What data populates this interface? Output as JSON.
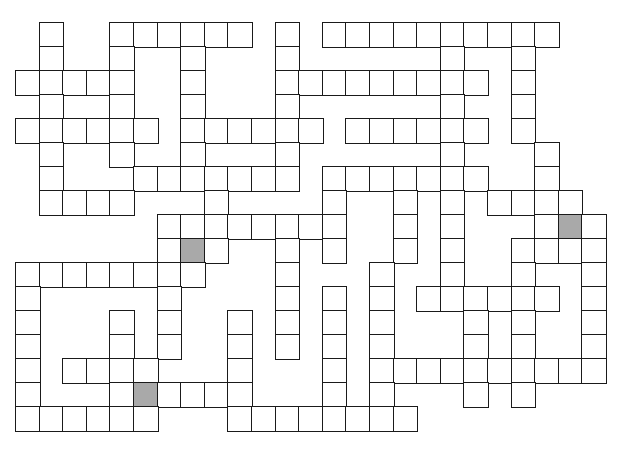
{
  "puzzle": {
    "type": "crossword",
    "rows": 17,
    "cols": 25,
    "colors": {
      "cell": "#ffffff",
      "border": "#1a1a1a",
      "shaded": "#a9a9a9"
    },
    "layout": [
      {
        "row": 0,
        "cells": [
          1,
          4,
          5,
          6,
          7,
          8,
          9,
          11,
          13,
          14,
          15,
          16,
          17,
          18,
          19,
          20,
          21,
          22
        ]
      },
      {
        "row": 1,
        "cells": [
          1,
          4,
          7,
          11,
          18,
          21
        ]
      },
      {
        "row": 2,
        "cells": [
          0,
          1,
          2,
          3,
          4,
          7,
          11,
          12,
          13,
          14,
          15,
          16,
          17,
          18,
          19,
          21
        ]
      },
      {
        "row": 3,
        "cells": [
          1,
          4,
          7,
          11,
          18,
          21
        ]
      },
      {
        "row": 4,
        "cells": [
          0,
          1,
          2,
          3,
          4,
          5,
          7,
          8,
          9,
          10,
          11,
          12,
          14,
          15,
          16,
          17,
          18,
          19,
          21
        ]
      },
      {
        "row": 5,
        "cells": [
          1,
          4,
          7,
          11,
          18,
          22
        ]
      },
      {
        "row": 6,
        "cells": [
          1,
          5,
          6,
          7,
          8,
          9,
          10,
          11,
          13,
          14,
          15,
          16,
          17,
          18,
          19,
          22
        ]
      },
      {
        "row": 7,
        "cells": [
          1,
          2,
          3,
          4,
          8,
          13,
          16,
          18,
          20,
          21,
          22,
          23
        ]
      },
      {
        "row": 8,
        "cells": [
          6,
          7,
          8,
          9,
          10,
          11,
          12,
          13,
          16,
          18,
          22,
          23,
          24
        ]
      },
      {
        "row": 9,
        "cells": [
          6,
          7,
          8,
          11,
          13,
          16,
          18,
          21,
          22,
          23,
          24
        ]
      },
      {
        "row": 10,
        "cells": [
          0,
          1,
          2,
          3,
          4,
          5,
          6,
          7,
          11,
          15,
          18,
          21,
          24
        ]
      },
      {
        "row": 11,
        "cells": [
          0,
          6,
          11,
          13,
          15,
          17,
          18,
          19,
          20,
          21,
          22,
          24
        ]
      },
      {
        "row": 12,
        "cells": [
          0,
          4,
          6,
          9,
          11,
          13,
          15,
          19,
          21,
          24
        ]
      },
      {
        "row": 13,
        "cells": [
          0,
          4,
          6,
          9,
          11,
          13,
          15,
          19,
          21,
          24
        ]
      },
      {
        "row": 14,
        "cells": [
          0,
          2,
          3,
          4,
          5,
          9,
          13,
          15,
          16,
          17,
          18,
          19,
          20,
          21,
          22,
          23,
          24
        ]
      },
      {
        "row": 15,
        "cells": [
          0,
          4,
          5,
          6,
          7,
          8,
          9,
          13,
          15,
          19,
          21
        ]
      },
      {
        "row": 16,
        "cells": [
          0,
          1,
          2,
          3,
          4,
          5,
          9,
          10,
          11,
          12,
          13,
          14,
          15,
          16
        ]
      }
    ],
    "shaded_cells": [
      {
        "row": 8,
        "col": 23
      },
      {
        "row": 9,
        "col": 7
      },
      {
        "row": 15,
        "col": 5
      }
    ]
  }
}
